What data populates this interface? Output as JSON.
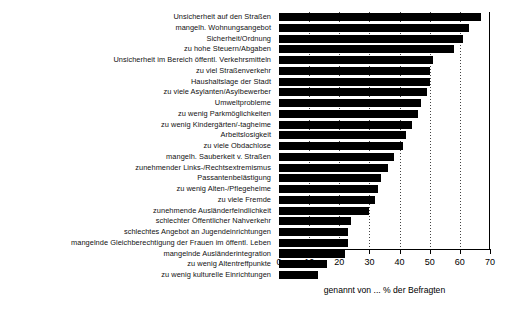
{
  "chart_data": {
    "type": "bar",
    "orientation": "horizontal",
    "title": "",
    "xlabel": "genannt von ... % der Befragten",
    "ylabel": "",
    "xlim": [
      0,
      70
    ],
    "xticks": [
      0,
      10,
      20,
      30,
      40,
      50,
      60,
      70
    ],
    "grid": true,
    "grid_axis": "x",
    "legend": "none",
    "bar_color": "#000000",
    "categories": [
      "Unsicherheit auf den Straßen",
      "mangelh. Wohnungsangebot",
      "Sicherheit/Ordnung",
      "zu hohe Steuern/Abgaben",
      "Unsicherheit im Bereich öffentl. Verkehrsmitteln",
      "zu viel Straßenverkehr",
      "Haushaltslage der Stadt",
      "zu viele Asylanten/Asylbewerber",
      "Umweltprobleme",
      "zu wenig Parkmöglichkeiten",
      "zu wenig Kindergärten/-tagheime",
      "Arbeitslosigkeit",
      "zu viele Obdachlose",
      "mangelh. Sauberkeit v. Straßen",
      "zunehmender Links-/Rechtsextremismus",
      "Passantenbelästigung",
      "zu wenig Alten-/Pflegeheime",
      "zu viele Fremde",
      "zunehmende Ausländerfeindlichkeit",
      "schlechter Öffentlicher Nahverkehr",
      "schlechtes Angebot an Jugendeinrichtungen",
      "mangelnde Gleichberechtigung der Frauen im öffentl. Leben",
      "mangelnde Ausländerintegration",
      "zu wenig Altentreffpunkte",
      "zu wenig kulturelle Einrichtungen"
    ],
    "values": [
      67,
      63,
      61,
      58,
      51,
      50,
      50,
      49,
      47,
      46,
      44,
      42,
      41,
      38,
      36,
      34,
      33,
      32,
      30,
      24,
      23,
      23,
      22,
      16,
      13
    ]
  }
}
